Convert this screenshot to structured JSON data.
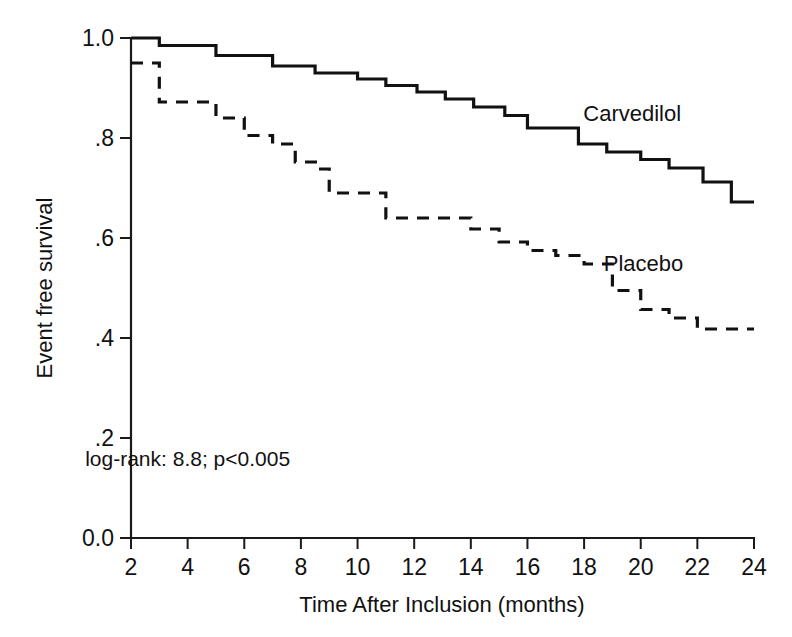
{
  "chart_data": {
    "type": "line",
    "title": "",
    "subtitle": "",
    "xlabel": "Time After Inclusion (months)",
    "ylabel": "Event free survival",
    "xlim": [
      2,
      24
    ],
    "ylim": [
      0.0,
      1.0
    ],
    "grid": false,
    "legend_position": "inline-annotation",
    "xticks": [
      2,
      4,
      6,
      8,
      10,
      12,
      14,
      16,
      18,
      20,
      22,
      24
    ],
    "xtick_labels": [
      "2",
      "4",
      "6",
      "8",
      "10",
      "12",
      "14",
      "16",
      "18",
      "20",
      "22",
      "24"
    ],
    "yticks": [
      0.0,
      0.2,
      0.4,
      0.6,
      0.8,
      1.0
    ],
    "ytick_labels": [
      "0.0",
      ".2",
      ".4",
      ".6",
      ".8",
      "1.0"
    ],
    "annotations": [
      {
        "name": "log-rank-statistic",
        "text": "log-rank: 8.8; p<0.005",
        "x": 4.0,
        "y": 0.145
      }
    ],
    "series": [
      {
        "name": "Carvedilol",
        "style": "solid",
        "color": "#111111",
        "label_x": 19.7,
        "label_y": 0.835,
        "step": "post",
        "x": [
          2.0,
          3.0,
          3.0,
          5.0,
          5.0,
          7.0,
          7.0,
          8.5,
          8.5,
          10.0,
          10.0,
          11.0,
          11.0,
          12.1,
          12.1,
          13.1,
          13.1,
          14.1,
          14.1,
          15.2,
          15.2,
          16.0,
          16.0,
          17.8,
          17.8,
          18.8,
          18.8,
          20.0,
          20.0,
          21.0,
          21.0,
          22.2,
          22.2,
          23.2,
          23.2,
          24.0
        ],
        "y": [
          1.0,
          1.0,
          0.985,
          0.985,
          0.965,
          0.965,
          0.944,
          0.944,
          0.93,
          0.93,
          0.918,
          0.918,
          0.905,
          0.905,
          0.892,
          0.892,
          0.878,
          0.878,
          0.862,
          0.862,
          0.845,
          0.845,
          0.82,
          0.82,
          0.788,
          0.788,
          0.772,
          0.772,
          0.757,
          0.757,
          0.74,
          0.74,
          0.712,
          0.712,
          0.672,
          0.672
        ]
      },
      {
        "name": "Placebo",
        "style": "dashed",
        "color": "#111111",
        "label_x": 20.1,
        "label_y": 0.535,
        "step": "post",
        "x": [
          2.0,
          3.0,
          3.0,
          5.0,
          5.0,
          6.0,
          6.0,
          7.0,
          7.0,
          7.8,
          7.8,
          8.6,
          8.6,
          9.0,
          9.0,
          11.0,
          11.0,
          12.0,
          12.0,
          12.9,
          12.9,
          14.0,
          14.0,
          15.0,
          15.0,
          16.0,
          16.0,
          17.0,
          17.0,
          18.0,
          18.0,
          19.0,
          19.0,
          20.0,
          20.0,
          21.0,
          21.0,
          22.0,
          22.0,
          24.0
        ],
        "y": [
          0.95,
          0.95,
          0.872,
          0.872,
          0.84,
          0.84,
          0.805,
          0.805,
          0.788,
          0.788,
          0.752,
          0.752,
          0.738,
          0.738,
          0.69,
          0.69,
          0.64,
          0.64,
          0.64,
          0.64,
          0.64,
          0.64,
          0.618,
          0.618,
          0.592,
          0.592,
          0.575,
          0.575,
          0.565,
          0.565,
          0.548,
          0.548,
          0.495,
          0.495,
          0.457,
          0.457,
          0.44,
          0.44,
          0.418,
          0.418
        ]
      }
    ]
  },
  "figure": {
    "background": "#ffffff",
    "foreground": "#111111"
  }
}
